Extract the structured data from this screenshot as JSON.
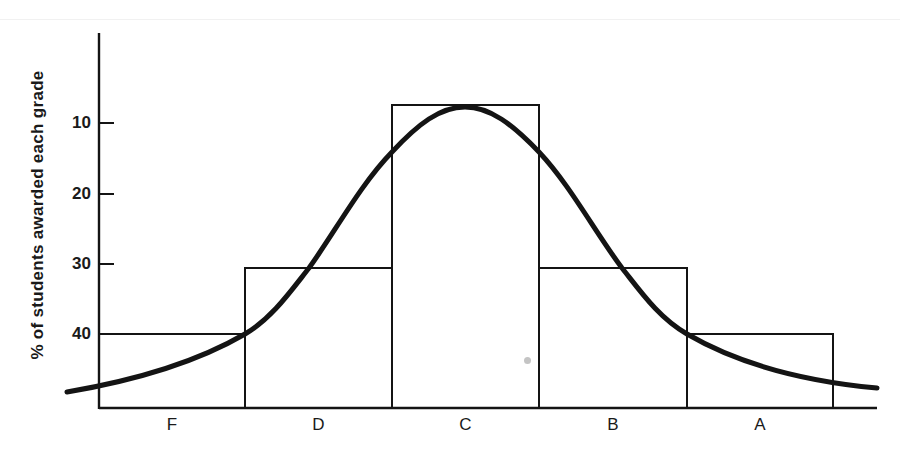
{
  "chart_data": {
    "type": "bar",
    "title": "",
    "xlabel": "",
    "ylabel": "% of students awarded each grade",
    "categories": [
      "F",
      "D",
      "C",
      "B",
      "A"
    ],
    "values": [
      40,
      30,
      7,
      30,
      40
    ],
    "value_note": "Values read against the printed y-axis tick labels, which increase downward (10 at top, 40 near bottom). Bar heights above the baseline are symmetric: F=A shortest, D=B medium, C tallest.",
    "y_ticks": [
      10,
      20,
      30,
      40
    ],
    "y_axis_inverted": true,
    "ylim": [
      5,
      50
    ],
    "grid": false,
    "legend": null,
    "overlay": {
      "type": "line",
      "name": "normal curve",
      "description": "Smooth bell-shaped (normal distribution) curve peaking over C, symmetric about the C bar, tails extending beyond F and A"
    }
  },
  "layout_px": {
    "axis_x": 99,
    "axis_top": 33,
    "baseline_y": 408,
    "baseline_end_x": 877,
    "tick_len": 15,
    "ticks": [
      {
        "label": "10",
        "y": 123
      },
      {
        "label": "20",
        "y": 194
      },
      {
        "label": "30",
        "y": 264
      },
      {
        "label": "40",
        "y": 334
      }
    ],
    "bars": [
      {
        "label": "F",
        "x0": 99,
        "x1": 245,
        "top": 334
      },
      {
        "label": "D",
        "x0": 245,
        "x1": 392,
        "top": 268
      },
      {
        "label": "C",
        "x0": 392,
        "x1": 539,
        "top": 105
      },
      {
        "label": "B",
        "x0": 539,
        "x1": 687,
        "top": 268
      },
      {
        "label": "A",
        "x0": 687,
        "x1": 833,
        "top": 334
      }
    ],
    "curve_path": "M67,392 C120,383 190,366 245,334 C272,318 290,292 309,268 C335,232 360,185 392,152 C418,124 440,107 465,107 C490,107 512,124 539,152 C570,185 595,232 622,268 C641,292 659,318 687,334 C742,366 812,382 877,388",
    "ink_color": "#141414"
  }
}
